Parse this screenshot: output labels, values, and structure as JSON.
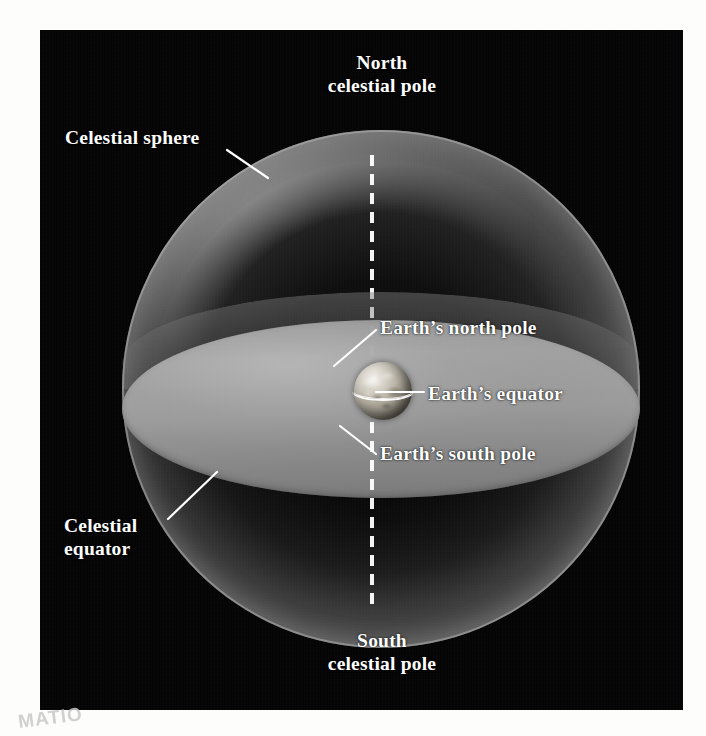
{
  "figure": {
    "kind": "astronomy-diagram",
    "background_color": "#040404",
    "page_color": "#ffffff",
    "label_color": "#ffffff"
  },
  "labels": {
    "north_celestial_pole": {
      "line1": "North",
      "line2": "celestial pole"
    },
    "south_celestial_pole": {
      "line1": "South",
      "line2": "celestial pole"
    },
    "celestial_sphere": "Celestial sphere",
    "celestial_equator": {
      "line1": "Celestial",
      "line2": "equator"
    },
    "earths_north_pole": "Earth’s north pole",
    "earths_equator": "Earth’s equator",
    "earths_south_pole": "Earth’s south pole"
  },
  "elements": {
    "celestial_sphere_name": "celestial-sphere",
    "celestial_equator_name": "celestial-equator-plane",
    "earth_name": "earth-globe",
    "earth_equator_name": "earth-equator-line",
    "rotation_axis_name": "rotation-axis-dashed-line"
  },
  "seal": {
    "text": "MATIO"
  }
}
